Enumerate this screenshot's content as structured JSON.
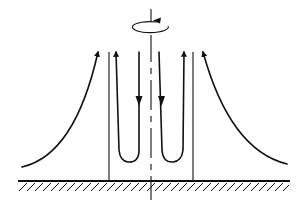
{
  "diagram": {
    "colors": {
      "ink": "#111111",
      "background": "#ffffff"
    },
    "elements": {
      "rotation_axis": {
        "style": "dash-dot",
        "label": ""
      },
      "rotation_indicator": {
        "icon": "rotation-arrow-icon",
        "direction": "counter-clockwise"
      },
      "core_boundaries": {
        "count": 2
      },
      "inner_flow_loops": {
        "count": 2,
        "direction": "down-near-axis-up-outward"
      },
      "outer_flow_curves": {
        "count": 2,
        "direction": "inflow-then-rising"
      },
      "ground": {
        "style": "hatched"
      }
    }
  }
}
